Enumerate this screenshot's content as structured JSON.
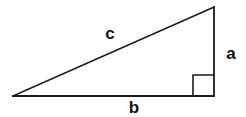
{
  "diagram": {
    "background_color": "#ffffff",
    "stroke_color": "#1a1a1a",
    "label_color": "#111111",
    "labels": {
      "hypotenuse": "c",
      "vertical_leg": "a",
      "horizontal_leg": "b"
    },
    "geometry": {
      "vertex_left": {
        "x": 13,
        "y": 96
      },
      "vertex_right_angle": {
        "x": 214,
        "y": 96
      },
      "vertex_apex": {
        "x": 214,
        "y": 7
      },
      "right_angle_marker": {
        "x": 193,
        "y": 75,
        "size": 21
      },
      "label_positions": {
        "hypotenuse": {
          "x": 110,
          "y": 39
        },
        "vertical_leg": {
          "x": 231,
          "y": 59
        },
        "horizontal_leg": {
          "x": 134,
          "y": 113
        }
      },
      "stroke_width": 1.6
    }
  }
}
